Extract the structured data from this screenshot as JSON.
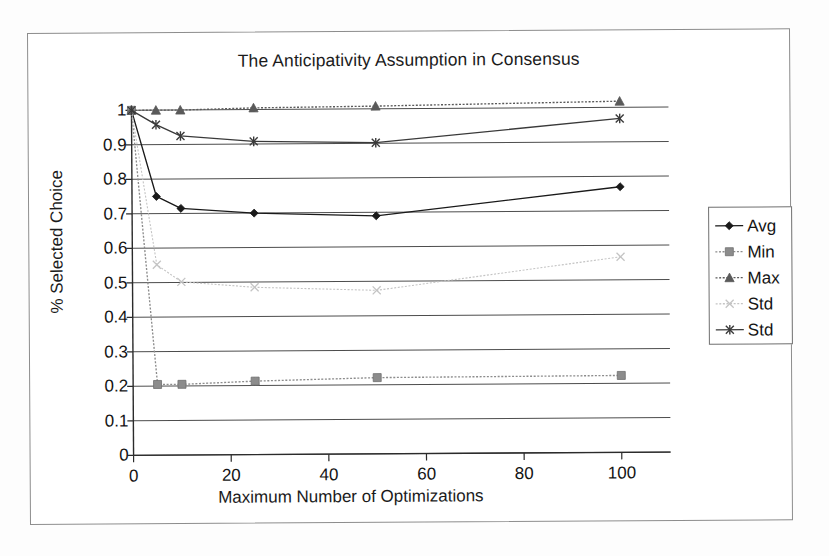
{
  "chart_data": {
    "type": "line",
    "title": "The Anticipativity Assumption in Consensus",
    "xlabel": "Maximum Number of Optimizations",
    "ylabel": "% Selected Choice",
    "xlim": [
      0,
      110
    ],
    "ylim": [
      0,
      1
    ],
    "grid": "horizontal",
    "legend_position": "right",
    "x": [
      0,
      5,
      10,
      25,
      50,
      100
    ],
    "xticks": [
      0,
      20,
      40,
      60,
      80,
      100
    ],
    "xtick_labels": [
      "0",
      "20",
      "40",
      "60",
      "80",
      "100"
    ],
    "yticks": [
      0,
      0.1,
      0.2,
      0.3,
      0.4,
      0.5,
      0.6,
      0.7,
      0.8,
      0.9,
      1
    ],
    "ytick_labels": [
      "0",
      "0.1",
      "0.2",
      "0.3",
      "0.4",
      "0.5",
      "0.6",
      "0.7",
      "0.8",
      "0.9",
      "1"
    ],
    "series": [
      {
        "name": "Avg",
        "marker": "diamond",
        "color": "#1a1a1a",
        "values": [
          1.0,
          0.75,
          0.715,
          0.7,
          0.69,
          0.77
        ]
      },
      {
        "name": "Min",
        "marker": "square",
        "color": "#8c8c8c",
        "values": [
          1.0,
          0.205,
          0.205,
          0.213,
          0.221,
          0.223
        ]
      },
      {
        "name": "Max",
        "marker": "triangle",
        "color": "#5a5a5a",
        "values": [
          1.0,
          1.0,
          1.0,
          1.005,
          1.008,
          1.018
        ]
      },
      {
        "name": "Std",
        "marker": "cross",
        "color": "#c4c4c4",
        "values": [
          1.0,
          0.552,
          0.502,
          0.485,
          0.474,
          0.567
        ]
      },
      {
        "name": "Std",
        "marker": "asterisk",
        "color": "#3a3a3a",
        "values": [
          1.0,
          0.958,
          0.925,
          0.908,
          0.902,
          0.968
        ]
      }
    ]
  },
  "legend": {
    "items": [
      {
        "label": "Avg",
        "marker": "diamond",
        "color": "#1a1a1a"
      },
      {
        "label": "Min",
        "marker": "square",
        "color": "#8c8c8c"
      },
      {
        "label": "Max",
        "marker": "triangle",
        "color": "#5a5a5a"
      },
      {
        "label": "Std",
        "marker": "cross",
        "color": "#c4c4c4"
      },
      {
        "label": "Std",
        "marker": "asterisk",
        "color": "#3a3a3a"
      }
    ]
  }
}
